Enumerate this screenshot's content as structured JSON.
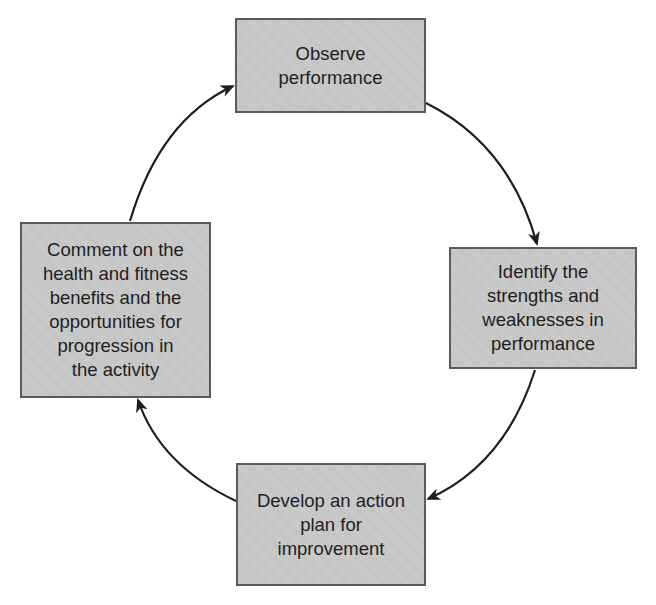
{
  "diagram": {
    "type": "cycle",
    "title": "",
    "box_fill": "#c9c9c9",
    "box_border": "#5a5a5a",
    "arrow_color": "#1e1e1e",
    "steps": [
      {
        "id": "observe",
        "label": "Observe\nperformance"
      },
      {
        "id": "identify",
        "label": "Identify the\nstrengths and\nweaknesses in\nperformance"
      },
      {
        "id": "develop",
        "label": "Develop an action\nplan for\nimprovement"
      },
      {
        "id": "comment",
        "label": "Comment on the\nhealth and fitness\nbenefits and the\nopportunities for\nprogression in\nthe activity"
      }
    ],
    "connections": [
      {
        "from": "observe",
        "to": "identify"
      },
      {
        "from": "identify",
        "to": "develop"
      },
      {
        "from": "develop",
        "to": "comment"
      },
      {
        "from": "comment",
        "to": "observe"
      }
    ]
  }
}
